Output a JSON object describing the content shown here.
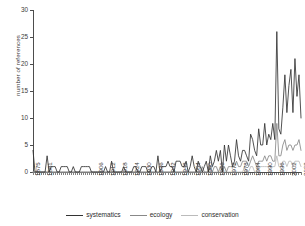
{
  "chart_data": {
    "type": "line",
    "title": "",
    "xlabel": "",
    "ylabel": "number of references",
    "ylim": [
      0,
      30
    ],
    "yticks": [
      0,
      5,
      10,
      15,
      20,
      25,
      30
    ],
    "xlim": [
      1875,
      2008
    ],
    "xticks": [
      1875,
      1881,
      1906,
      1912,
      1918,
      1924,
      1930,
      1936,
      1942,
      1948,
      1954,
      1960,
      1966,
      1972,
      1978,
      1984,
      1990,
      1996,
      2002,
      2008
    ],
    "grid": false,
    "legend_position": "bottom",
    "x": [
      1875,
      1876,
      1877,
      1878,
      1879,
      1880,
      1881,
      1882,
      1883,
      1884,
      1885,
      1886,
      1887,
      1888,
      1889,
      1890,
      1891,
      1892,
      1893,
      1894,
      1895,
      1896,
      1897,
      1898,
      1899,
      1900,
      1901,
      1902,
      1903,
      1904,
      1905,
      1906,
      1907,
      1908,
      1909,
      1910,
      1911,
      1912,
      1913,
      1914,
      1915,
      1916,
      1917,
      1918,
      1919,
      1920,
      1921,
      1922,
      1923,
      1924,
      1925,
      1926,
      1927,
      1928,
      1929,
      1930,
      1931,
      1932,
      1933,
      1934,
      1935,
      1936,
      1937,
      1938,
      1939,
      1940,
      1941,
      1942,
      1943,
      1944,
      1945,
      1946,
      1947,
      1948,
      1949,
      1950,
      1951,
      1952,
      1953,
      1954,
      1955,
      1956,
      1957,
      1958,
      1959,
      1960,
      1961,
      1962,
      1963,
      1964,
      1965,
      1966,
      1967,
      1968,
      1969,
      1970,
      1971,
      1972,
      1973,
      1974,
      1975,
      1976,
      1977,
      1978,
      1979,
      1980,
      1981,
      1982,
      1983,
      1984,
      1985,
      1986,
      1987,
      1988,
      1989,
      1990,
      1991,
      1992,
      1993,
      1994,
      1995,
      1996,
      1997,
      1998,
      1999,
      2000,
      2001,
      2002,
      2003,
      2004,
      2005,
      2006,
      2007,
      2008
    ],
    "series": [
      {
        "name": "systematics",
        "color": "#333333",
        "values": [
          4,
          0,
          0,
          0,
          0,
          0,
          0,
          3,
          0,
          1,
          1,
          1,
          0,
          0,
          1,
          1,
          1,
          1,
          0,
          0,
          1,
          0,
          0,
          0,
          1,
          1,
          1,
          1,
          1,
          0,
          0,
          0,
          0,
          0,
          0,
          0,
          1,
          0,
          0,
          2,
          0,
          0,
          0,
          0,
          0,
          1,
          0,
          0,
          0,
          0,
          1,
          1,
          0,
          0,
          1,
          1,
          1,
          0,
          0,
          1,
          1,
          0,
          3,
          0,
          1,
          1,
          1,
          2,
          1,
          1,
          0,
          2,
          2,
          2,
          1,
          1,
          2,
          0,
          1,
          3,
          1,
          0,
          2,
          1,
          0,
          1,
          2,
          0,
          3,
          1,
          2,
          4,
          2,
          4,
          0,
          5,
          2,
          5,
          3,
          1,
          2,
          6,
          3,
          2,
          4,
          4,
          3,
          2,
          7,
          6,
          4,
          3,
          8,
          5,
          5,
          9,
          5,
          7,
          6,
          9,
          6,
          26,
          8,
          7,
          12,
          18,
          11,
          16,
          19,
          11,
          21,
          14,
          18,
          10
        ]
      },
      {
        "name": "ecology",
        "color": "#888888",
        "values": [
          0,
          0,
          0,
          0,
          0,
          0,
          0,
          0,
          0,
          0,
          0,
          0,
          0,
          0,
          0,
          0,
          0,
          0,
          0,
          0,
          0,
          0,
          0,
          0,
          0,
          0,
          0,
          0,
          0,
          0,
          0,
          0,
          0,
          0,
          0,
          0,
          0,
          0,
          0,
          0,
          0,
          0,
          0,
          0,
          0,
          0,
          0,
          0,
          0,
          0,
          0,
          0,
          0,
          0,
          0,
          0,
          0,
          0,
          0,
          0,
          0,
          0,
          0,
          0,
          0,
          0,
          0,
          0,
          0,
          0,
          0,
          0,
          0,
          0,
          0,
          0,
          0,
          0,
          0,
          0,
          0,
          0,
          0,
          0,
          1,
          0,
          0,
          0,
          1,
          0,
          1,
          1,
          0,
          1,
          0,
          1,
          0,
          1,
          1,
          1,
          1,
          2,
          1,
          1,
          2,
          2,
          2,
          1,
          2,
          3,
          2,
          1,
          2,
          2,
          2,
          3,
          2,
          3,
          3,
          2,
          2,
          9,
          3,
          3,
          5,
          6,
          4,
          5,
          5,
          4,
          5,
          5,
          6,
          4
        ]
      },
      {
        "name": "conservation",
        "color": "#bbbbbb",
        "values": [
          0,
          0,
          0,
          0,
          0,
          0,
          0,
          0,
          0,
          0,
          0,
          0,
          0,
          0,
          0,
          0,
          0,
          0,
          0,
          0,
          0,
          0,
          0,
          0,
          0,
          0,
          0,
          0,
          0,
          0,
          0,
          0,
          0,
          0,
          0,
          0,
          0,
          0,
          0,
          0,
          0,
          0,
          0,
          0,
          0,
          0,
          0,
          0,
          0,
          0,
          0,
          0,
          0,
          0,
          0,
          0,
          0,
          0,
          0,
          0,
          0,
          0,
          0,
          0,
          0,
          0,
          0,
          0,
          0,
          0,
          0,
          0,
          0,
          0,
          0,
          0,
          0,
          0,
          0,
          0,
          0,
          0,
          0,
          0,
          0,
          0,
          0,
          0,
          0,
          0,
          0,
          0,
          0,
          0,
          0,
          0,
          0,
          0,
          0,
          0,
          0,
          0,
          0,
          0,
          0,
          1,
          0,
          0,
          1,
          1,
          0,
          0,
          1,
          1,
          1,
          1,
          1,
          1,
          1,
          1,
          1,
          3,
          1,
          1,
          2,
          2,
          1,
          2,
          2,
          1,
          2,
          2,
          2,
          1
        ]
      }
    ]
  },
  "legend": {
    "items": [
      {
        "label": "systematics",
        "color": "#333333"
      },
      {
        "label": "ecology",
        "color": "#888888"
      },
      {
        "label": "conservation",
        "color": "#bbbbbb"
      }
    ]
  },
  "axis": {
    "y_title": "number of references",
    "axis_color": "#4d4d4d"
  }
}
